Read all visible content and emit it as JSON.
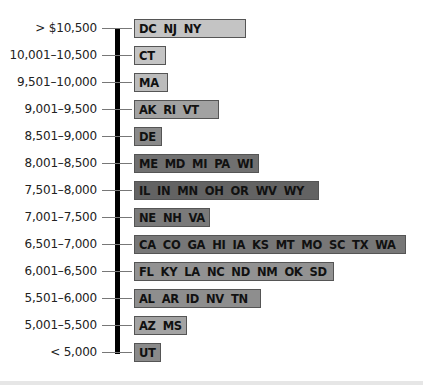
{
  "chart_data": {
    "type": "table",
    "title": "",
    "xlabel": "",
    "ylabel": "",
    "categories": [
      "> $10,500",
      "10,001–10,500",
      "9,501–10,000",
      "9,001–9,500",
      "8,501–9,000",
      "8,001–8,500",
      "7,501–8,000",
      "7,001–7,500",
      "6,501–7,000",
      "6,001–6,500",
      "5,501–6,000",
      "5,001–5,500",
      "< 5,000"
    ],
    "values": [
      3,
      1,
      1,
      3,
      1,
      5,
      7,
      3,
      11,
      8,
      5,
      2,
      1
    ],
    "rows": [
      {
        "range": "> $10,500",
        "states": [
          "DC",
          "NJ",
          "NY"
        ],
        "fill": "#c4c4c4",
        "width": 102
      },
      {
        "range": "10,001–10,500",
        "states": [
          "CT"
        ],
        "fill": "#c4c4c4",
        "width": 22
      },
      {
        "range": "9,501–10,000",
        "states": [
          "MA"
        ],
        "fill": "#bcbcbc",
        "width": 24
      },
      {
        "range": "9,001–9,500",
        "states": [
          "AK",
          "RI",
          "VT"
        ],
        "fill": "#a2a2a2",
        "width": 75
      },
      {
        "range": "8,501–9,000",
        "states": [
          "DE"
        ],
        "fill": "#8a8a8a",
        "width": 18
      },
      {
        "range": "8,001–8,500",
        "states": [
          "ME",
          "MD",
          "MI",
          "PA",
          "WI"
        ],
        "fill": "#707070",
        "width": 115
      },
      {
        "range": "7,501–8,000",
        "states": [
          "IL",
          "IN",
          "MN",
          "OH",
          "OR",
          "WV",
          "WY"
        ],
        "fill": "#636363",
        "width": 175
      },
      {
        "range": "7,001–7,500",
        "states": [
          "NE",
          "NH",
          "VA"
        ],
        "fill": "#7a7a7a",
        "width": 66
      },
      {
        "range": "6,501–7,000",
        "states": [
          "CA",
          "CO",
          "GA",
          "HI",
          "IA",
          "KS",
          "MT",
          "MO",
          "SC",
          "TX",
          "WA"
        ],
        "fill": "#777777",
        "width": 262
      },
      {
        "range": "6,001–6,500",
        "states": [
          "FL",
          "KY",
          "LA",
          "NC",
          "ND",
          "NM",
          "OK",
          "SD"
        ],
        "fill": "#929292",
        "width": 190
      },
      {
        "range": "5,501–6,000",
        "states": [
          "AL",
          "AR",
          "ID",
          "NV",
          "TN"
        ],
        "fill": "#8e8e8e",
        "width": 117
      },
      {
        "range": "5,001–5,500",
        "states": [
          "AZ",
          "MS"
        ],
        "fill": "#a3a3a3",
        "width": 43
      },
      {
        "range": "< 5,000",
        "states": [
          "UT"
        ],
        "fill": "#8a8a8a",
        "width": 17
      }
    ],
    "grid": false,
    "legend": null
  }
}
